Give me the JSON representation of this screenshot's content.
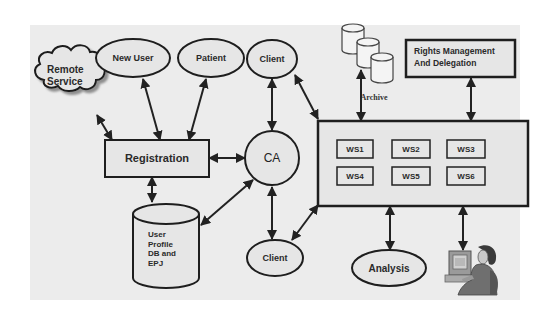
{
  "diagram": {
    "type": "system-architecture",
    "background_color": "#ececec",
    "stroke_color": "#1e1e1e",
    "fill_color": "#e6e6e6",
    "nodes": {
      "remote_service": {
        "label_line1": "Remote",
        "label_line2": "Service",
        "shape": "cloud"
      },
      "new_user": {
        "label": "New User",
        "shape": "ellipse"
      },
      "patient": {
        "label": "Patient",
        "shape": "ellipse"
      },
      "client_top": {
        "label": "Client",
        "shape": "ellipse"
      },
      "client_bottom": {
        "label": "Client",
        "shape": "ellipse"
      },
      "registration": {
        "label": "Registration",
        "shape": "rectangle"
      },
      "ca": {
        "label": "CA",
        "shape": "circle"
      },
      "user_profile_db": {
        "label_lines": [
          "User",
          "Profile",
          "DB and",
          "EPJ"
        ],
        "shape": "cylinder"
      },
      "archive": {
        "label": "Archive",
        "shape": "cylinder-stack"
      },
      "rights_management": {
        "label_line1": "Rights Management",
        "label_line2": "And Delegation",
        "shape": "rectangle"
      },
      "workstation_group": {
        "shape": "rectangle",
        "workstations": [
          {
            "label": "WS1"
          },
          {
            "label": "WS2"
          },
          {
            "label": "WS3"
          },
          {
            "label": "WS4"
          },
          {
            "label": "WS5"
          },
          {
            "label": "WS6"
          }
        ]
      },
      "analysis": {
        "label": "Analysis",
        "shape": "ellipse"
      },
      "user_at_computer": {
        "label": "",
        "shape": "clipart-person-computer"
      }
    },
    "edges": [
      {
        "from": "remote_service",
        "to": "registration",
        "direction": "bidirectional"
      },
      {
        "from": "new_user",
        "to": "registration",
        "direction": "bidirectional"
      },
      {
        "from": "patient",
        "to": "registration",
        "direction": "bidirectional"
      },
      {
        "from": "registration",
        "to": "ca",
        "direction": "bidirectional"
      },
      {
        "from": "registration",
        "to": "user_profile_db",
        "direction": "bidirectional"
      },
      {
        "from": "ca",
        "to": "user_profile_db",
        "direction": "bidirectional"
      },
      {
        "from": "client_top",
        "to": "ca",
        "direction": "bidirectional"
      },
      {
        "from": "ca",
        "to": "client_bottom",
        "direction": "bidirectional"
      },
      {
        "from": "client_top",
        "to": "workstation_group",
        "direction": "bidirectional"
      },
      {
        "from": "client_bottom",
        "to": "workstation_group",
        "direction": "bidirectional"
      },
      {
        "from": "archive",
        "to": "workstation_group",
        "direction": "bidirectional"
      },
      {
        "from": "rights_management",
        "to": "workstation_group",
        "direction": "bidirectional"
      },
      {
        "from": "workstation_group",
        "to": "analysis",
        "direction": "bidirectional"
      },
      {
        "from": "workstation_group",
        "to": "user_at_computer",
        "direction": "bidirectional"
      }
    ]
  }
}
